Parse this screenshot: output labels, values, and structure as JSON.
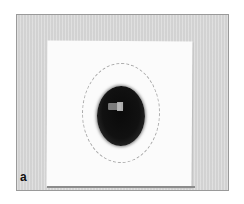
{
  "figure": {
    "panel_label": "a",
    "colors": {
      "background": "#d9d9d9",
      "card": "#fbfbfb",
      "object": "#0a0a0a",
      "outline": "#a8a8a8"
    }
  }
}
